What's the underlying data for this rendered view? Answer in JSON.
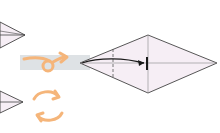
{
  "diagram": {
    "type": "origami-instruction",
    "colors": {
      "paper_fill": "#f6eef5",
      "outline": "#444444",
      "arrow": "#1a1a1a",
      "symbol_orange": "#f5b57a",
      "highlight_band": "#d8dde0"
    },
    "steps": [
      {
        "name": "previous-step-top",
        "shape": "kite",
        "partial": true
      },
      {
        "name": "previous-step-bottom",
        "shape": "kite",
        "partial": true
      },
      {
        "name": "current-step",
        "shape": "kite",
        "partial": false
      }
    ],
    "symbols": [
      {
        "name": "turn-over-icon",
        "meaning": "turn over"
      },
      {
        "name": "rotate-icon",
        "meaning": "rotate"
      },
      {
        "name": "fold-arrow",
        "meaning": "fold tip to center line"
      },
      {
        "name": "valley-fold-line",
        "meaning": "dashed fold line"
      }
    ]
  }
}
